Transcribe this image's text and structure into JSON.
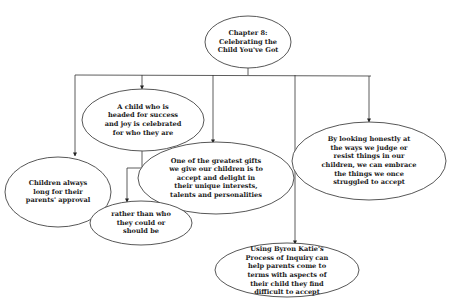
{
  "diagram": {
    "title": "Chapter 8: Celebrating the Child You've Got",
    "colors": {
      "line": "#333333",
      "fill": "#ffffff",
      "text": "#1a1a1a"
    },
    "nodes": {
      "root": {
        "text": "Chapter 8:\nCelebrating the\nChild You've Got"
      },
      "approval": {
        "text": "Children always\nlong for their\nparents' approval"
      },
      "celebrated": {
        "text": "A child who is\nheaded for success\nand joy is celebrated\nfor who they are"
      },
      "rather": {
        "text": "rather than who\nthey could or\nshould be"
      },
      "gifts": {
        "text": "One of the greatest gifts\nwe give our children is to\naccept and delight in\ntheir unique interests,\ntalents and personalities"
      },
      "katie": {
        "text": "Using Byron Katie's\nProcess of Inquiry can\nhelp parents come to\nterms with aspects of\ntheir child they find\ndifficult to accept"
      },
      "honestly": {
        "text": "By looking honestly at\nthe ways we judge or\nresist things in our\nchildren, we can embrace\nthe things we once\nstruggled to accept"
      }
    },
    "edges": [
      {
        "from": "root",
        "to": "approval"
      },
      {
        "from": "root",
        "to": "celebrated"
      },
      {
        "from": "root",
        "to": "gifts"
      },
      {
        "from": "root",
        "to": "katie"
      },
      {
        "from": "root",
        "to": "honestly"
      },
      {
        "from": "celebrated",
        "to": "rather"
      }
    ]
  }
}
